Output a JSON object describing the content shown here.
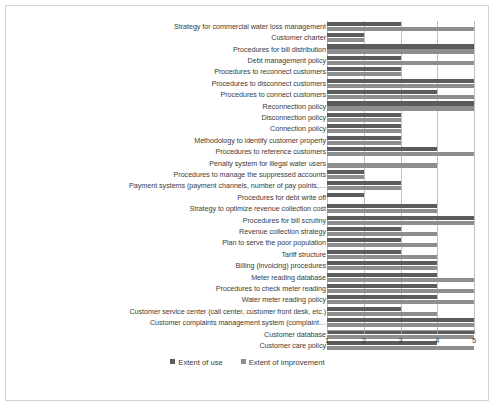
{
  "chart_data": {
    "type": "bar",
    "orientation": "horizontal",
    "title": "",
    "xlabel": "",
    "ylabel": "",
    "xlim": [
      1,
      5
    ],
    "xticks": [
      "1",
      "2",
      "3",
      "4",
      "5"
    ],
    "grid": true,
    "legend_position": "bottom",
    "colors": {
      "use": "#5c5c5c",
      "improvement": "#8e8e8e",
      "gridline": "#bfbfbf",
      "axis": "#9a9a9a",
      "text": "#3b3b3b",
      "background": "#ffffff",
      "border": "#d4d4d4"
    },
    "categories": [
      "Strategy for commercial water loss management",
      "Customer charter",
      "Procedures for bill distribution",
      "Debt management policy",
      "Procedures to reconnect customers",
      "Procedures to disconnect customers",
      "Procedures to connect customers",
      "Reconnection policy",
      "Disconnection policy",
      "Connection policy",
      "Methodology to identify customer property",
      "Procedures to reference customers",
      "Penalty system  for illegal water users",
      "Procedures to manage the suppressed accounts",
      "Payment systems (payment channels, number of pay points,…",
      "Procedures for debt write off",
      "Strategy to optimize revenue collection cost",
      "Procedures for bill scrutiny",
      "Revenue collection strategy",
      "Plan to serve the poor population",
      "Tariff structure",
      "Billing (invoicing) procedures",
      "Meter reading database",
      "Procedures to check meter reading",
      "Water meter reading policy",
      "Customer service center (call center, customer front desk, etc.)",
      "Customer complaints management system (complaint…",
      "Customer database",
      "Customer care policy"
    ],
    "series": [
      {
        "name": "Extent of use",
        "color": "#5c5c5c",
        "values": [
          3,
          2,
          5,
          3,
          3,
          5,
          4,
          5,
          3,
          3,
          3,
          4,
          1,
          2,
          3,
          2,
          4,
          5,
          3,
          3,
          3,
          4,
          4,
          4,
          4,
          3,
          5,
          5,
          4
        ]
      },
      {
        "name": "Extent of improvement",
        "color": "#8e8e8e",
        "values": [
          5,
          2,
          5,
          5,
          3,
          5,
          5,
          5,
          3,
          3,
          3,
          5,
          4,
          2,
          3,
          1,
          4,
          5,
          4,
          4,
          4,
          4,
          5,
          5,
          5,
          4,
          5,
          5,
          5
        ]
      }
    ]
  },
  "legend": {
    "items": [
      {
        "label": "Extent of use",
        "color": "#5c5c5c"
      },
      {
        "label": "Extent of improvement",
        "color": "#8e8e8e"
      }
    ]
  }
}
